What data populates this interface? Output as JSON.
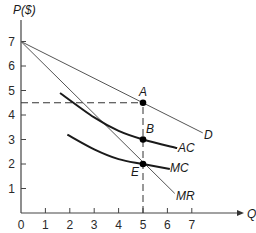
{
  "chart_data": {
    "type": "line",
    "title": "",
    "xlabel": "Q",
    "ylabel": "P($)",
    "xlim": [
      0,
      8.5
    ],
    "ylim": [
      0,
      7.8
    ],
    "grid": false,
    "x_ticks": [
      "0",
      "1",
      "2",
      "3",
      "4",
      "5",
      "6",
      "7"
    ],
    "y_ticks": [
      "1",
      "2",
      "3",
      "4",
      "5",
      "6",
      "7"
    ],
    "series": [
      {
        "name": "D",
        "kind": "linear",
        "points": [
          [
            0,
            7
          ],
          [
            7.45,
            3.27
          ]
        ],
        "color": "#555555"
      },
      {
        "name": "MR",
        "kind": "linear",
        "points": [
          [
            0,
            7
          ],
          [
            6.3,
            0.8
          ]
        ],
        "color": "#555555"
      },
      {
        "name": "AC",
        "kind": "curve",
        "points": [
          [
            1.6,
            4.9
          ],
          [
            3,
            3.9
          ],
          [
            4,
            3.35
          ],
          [
            5,
            3.0
          ],
          [
            6.4,
            2.65
          ]
        ],
        "color": "#1a1a1a"
      },
      {
        "name": "MC",
        "kind": "curve",
        "points": [
          [
            1.9,
            3.2
          ],
          [
            3,
            2.6
          ],
          [
            4,
            2.2
          ],
          [
            5,
            2.0
          ],
          [
            6.1,
            1.8
          ]
        ],
        "color": "#1a1a1a"
      }
    ],
    "points": [
      {
        "label": "A",
        "x": 5,
        "y": 4.5
      },
      {
        "label": "B",
        "x": 5,
        "y": 3
      },
      {
        "label": "E",
        "x": 5,
        "y": 2
      }
    ],
    "reference_lines": [
      {
        "type": "horizontal",
        "y": 4.5,
        "from_x": 0,
        "to_x": 5,
        "style": "dashed"
      },
      {
        "type": "vertical",
        "x": 5,
        "from_y": 0,
        "to_y": 4.5,
        "style": "dashed"
      }
    ],
    "labels": {
      "D": "D",
      "MR": "MR",
      "AC": "AC",
      "MC": "MC",
      "A": "A",
      "B": "B",
      "E": "E"
    }
  },
  "axes": {
    "y_title": "P($)",
    "x_title": "Q"
  }
}
